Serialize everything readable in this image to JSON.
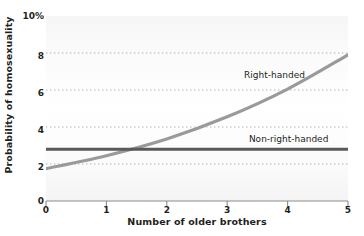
{
  "chart_data": {
    "type": "line",
    "title": "",
    "xlabel": "Number of older brothers",
    "ylabel": "Probability of homosexuality",
    "xlim": [
      0,
      5
    ],
    "ylim": [
      0,
      10
    ],
    "xticks": [
      "0",
      "1",
      "2",
      "3",
      "4",
      "5"
    ],
    "yticks": [
      "0",
      "2",
      "4",
      "6",
      "8",
      "10%"
    ],
    "ytick_values": [
      0,
      2,
      4,
      6,
      8,
      10
    ],
    "xtick_values": [
      0,
      1,
      2,
      3,
      4,
      5
    ],
    "grid": "horizontal-dotted",
    "gridlines_at": [
      2,
      4,
      6,
      8
    ],
    "legend_position": "inline-annotation",
    "x": [
      0,
      1,
      2,
      3,
      4,
      5
    ],
    "series": [
      {
        "name": "Right-handed",
        "values": [
          1.75,
          2.45,
          3.35,
          4.55,
          6.05,
          7.9
        ],
        "color": "#9a9a9a",
        "style": "solid",
        "width": 3.2
      },
      {
        "name": "Non-right-handed",
        "values": [
          2.8,
          2.8,
          2.8,
          2.8,
          2.8,
          2.8
        ],
        "color": "#58595b",
        "style": "solid",
        "width": 3.0
      }
    ],
    "annotations": [
      {
        "text": "Right-handed",
        "x": 3.28,
        "y": 6.75
      },
      {
        "text": "Non-right-handed",
        "x": 3.36,
        "y": 3.3
      }
    ]
  },
  "axes": {
    "y_title": "Probability of homosexuality",
    "x_title": "Number of older brothers",
    "y_labels": [
      "10%",
      "8",
      "6",
      "4",
      "2",
      "0"
    ],
    "x_labels": [
      "0",
      "1",
      "2",
      "3",
      "4",
      "5"
    ]
  },
  "labels": {
    "right_handed": "Right-handed",
    "non_right_handed": "Non-right-handed"
  },
  "colors": {
    "right_handed": "#9a9a9a",
    "non_right_handed": "#58595b",
    "gridline": "#b8b8b8",
    "axis": "#8c8c8c",
    "text": "#231f20",
    "plot_background": "#fbfbfb"
  }
}
